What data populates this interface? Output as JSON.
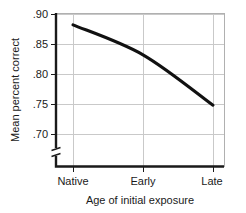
{
  "chart_data": {
    "type": "line",
    "title": "",
    "xlabel": "Age of initial exposure",
    "ylabel": "Mean percent correct",
    "categories": [
      "Native",
      "Early",
      "Late"
    ],
    "values": [
      0.882,
      0.832,
      0.748
    ],
    "series": [
      {
        "name": "Mean percent correct",
        "values": [
          0.882,
          0.832,
          0.748
        ]
      }
    ],
    "ylim": [
      0.7,
      0.9
    ],
    "yticks": [
      0.9,
      0.85,
      0.8,
      0.75,
      0.7
    ],
    "ytick_labels": [
      ".90",
      ".85",
      ".80",
      ".75",
      ".70"
    ],
    "xtick_labels": [
      "Native",
      "Early",
      "Late"
    ],
    "grid": "horizontal-and-vertical",
    "legend": "none",
    "axis_break": "y-axis below .70",
    "line_color": "#111111",
    "grid_color": "#c9c9c9",
    "axis_color": "#1a1a1a"
  },
  "labels": {
    "y_tick_0": ".90",
    "y_tick_1": ".85",
    "y_tick_2": ".80",
    "y_tick_3": ".75",
    "y_tick_4": ".70",
    "x_tick_0": "Native",
    "x_tick_1": "Early",
    "x_tick_2": "Late",
    "x_axis_title": "Age of initial exposure",
    "y_axis_title": "Mean percent correct"
  }
}
